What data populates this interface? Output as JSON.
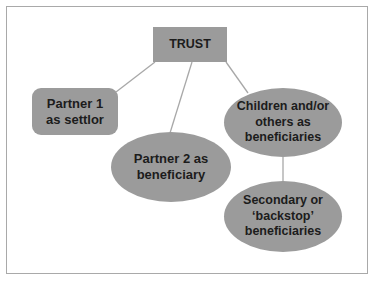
{
  "diagram": {
    "type": "tree",
    "colors": {
      "node_fill": "#9b9b9b",
      "text": "#1c1c1c",
      "connector": "#a8a8a8",
      "frame_border": "#a9a9a9",
      "background": "#ffffff"
    },
    "nodes": {
      "trust": {
        "label": "TRUST",
        "shape": "rectangle"
      },
      "partner1": {
        "label": "Partner 1\nas settlor",
        "shape": "rounded-rectangle"
      },
      "partner2": {
        "label": "Partner 2 as\nbeneficiary",
        "shape": "ellipse"
      },
      "children": {
        "label": "Children and/or\nothers as\nbeneficiaries",
        "shape": "ellipse"
      },
      "secondary": {
        "label": "Secondary or\n‘backstop’\nbeneficiaries",
        "shape": "ellipse"
      }
    },
    "edges": [
      {
        "from": "trust",
        "to": "partner1"
      },
      {
        "from": "trust",
        "to": "partner2"
      },
      {
        "from": "trust",
        "to": "children"
      },
      {
        "from": "children",
        "to": "secondary"
      }
    ]
  }
}
